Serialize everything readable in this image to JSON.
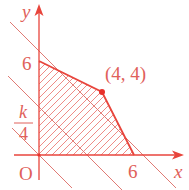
{
  "diagram": {
    "type": "linear-programming-feasible-region",
    "colors": {
      "axis": "#e8453c",
      "boundary": "#e8453c",
      "guide_line": "#e07a74",
      "hatch": "#ee8c87",
      "label": "#e0605a",
      "point": "#e8302a"
    },
    "axes": {
      "x_label": "x",
      "y_label": "y",
      "origin_label": "O"
    },
    "tick_labels": {
      "y_six": "6",
      "x_six": "6",
      "k_numerator": "k",
      "k_denominator": "4"
    },
    "vertex": {
      "label": "(4, 4)",
      "x": 4,
      "y": 4
    },
    "feasible_region": {
      "vertices": [
        [
          0,
          0
        ],
        [
          0,
          6
        ],
        [
          4,
          4
        ],
        [
          6,
          0
        ]
      ],
      "fill": "hatched"
    },
    "lines": [
      {
        "name": "x+y=8",
        "through": [
          [
            0,
            8
          ],
          [
            8,
            0
          ]
        ]
      },
      {
        "name": "x+y=k/4",
        "through": [
          [
            0,
            3
          ],
          [
            3,
            0
          ]
        ]
      },
      {
        "name": "x+y=0",
        "through": [
          [
            0,
            0
          ]
        ]
      }
    ]
  }
}
